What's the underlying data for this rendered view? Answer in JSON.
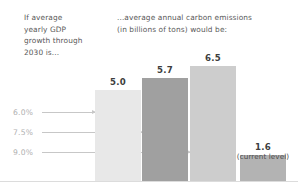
{
  "captions": {
    "left": "If average\nyearly GDP\ngrowth through\n2030 is...",
    "right": "...average annual carbon emissions\n(in billions of tons) would be:"
  },
  "chart_data": {
    "type": "bar",
    "title": "",
    "subtitle": "",
    "xlabel": "If average yearly GDP growth through 2030 is...",
    "ylabel": "...average annual carbon emissions (in billions of tons) would be:",
    "categories": [
      "6.0%",
      "7.5%",
      "9.0%",
      "current level"
    ],
    "values": [
      5.0,
      5.7,
      6.5,
      1.6
    ],
    "value_labels": [
      "5.0",
      "5.7",
      "6.5",
      "1.6"
    ],
    "annotations": [
      "",
      "",
      "",
      "(current level)"
    ],
    "axis_labels": [
      "6.0%",
      "7.5%",
      "9.0%"
    ],
    "ylim": [
      0,
      7.2
    ],
    "grid": false,
    "legend": "none",
    "bar_colors": [
      "#e8e8e8",
      "#a0a0a0",
      "#cdcdcd",
      "#b3b3b3"
    ],
    "axis_label_color": "#b0b0b0",
    "pointer_color": "#c7c7c7",
    "baseline_color": "#dcdcdc",
    "bars": [
      {
        "label": "6.0%",
        "value_label": "5.0",
        "note": "",
        "left": 95,
        "width": 46,
        "height": 91,
        "color": "#e8e8e8"
      },
      {
        "label": "7.5%",
        "value_label": "5.7",
        "note": "",
        "left": 142,
        "width": 46,
        "height": 103,
        "color": "#a0a0a0"
      },
      {
        "label": "9.0%",
        "value_label": "6.5",
        "note": "",
        "left": 190,
        "width": 46,
        "height": 115,
        "color": "#cdcdcd"
      },
      {
        "label": "today",
        "value_label": "1.6",
        "note": "(current level)",
        "left": 240,
        "width": 46,
        "height": 26,
        "color": "#b3b3b3"
      }
    ]
  }
}
